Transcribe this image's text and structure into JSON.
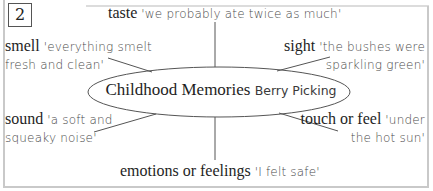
{
  "diagram": {
    "number": "2",
    "center": {
      "title": "Childhood Memories",
      "subtitle": "Berry Picking"
    },
    "senses": {
      "taste": {
        "label": "taste",
        "quote": "'we probably ate twice as much'"
      },
      "smell": {
        "label": "smell",
        "quote_line1": "'everything smelt",
        "quote_line2": "fresh and clean'"
      },
      "sight": {
        "label": "sight",
        "quote_line1": "'the bushes were",
        "quote_line2": "sparkling green'"
      },
      "sound": {
        "label": "sound",
        "quote_line1": "'a soft and",
        "quote_line2": "squeaky noise'"
      },
      "touch": {
        "label": "touch or feel",
        "quote_line1": "'under",
        "quote_line2": "the hot sun'"
      },
      "emotions": {
        "label": "emotions or feelings",
        "quote": "'I felt safe'"
      }
    },
    "colors": {
      "text": "#1e1e1e",
      "quote_text": "#4a4a4a",
      "lines": "#555555",
      "frame": "#c9c9c9"
    }
  }
}
